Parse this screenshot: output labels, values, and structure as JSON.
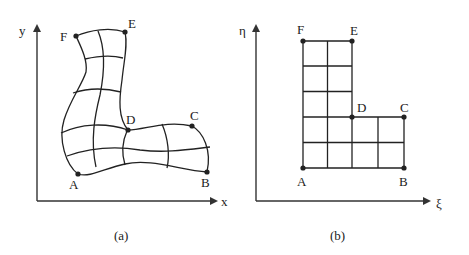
{
  "panels": [
    {
      "id": "a",
      "caption": "(a)",
      "axes": {
        "horizontal": "x",
        "vertical": "y"
      },
      "domain": "physical",
      "points": {
        "A": "A",
        "B": "B",
        "C": "C",
        "D": "D",
        "E": "E",
        "F": "F"
      },
      "description": "Curvilinear body-fitted grid over an L-shaped region in physical (x, y) space"
    },
    {
      "id": "b",
      "caption": "(b)",
      "axes": {
        "horizontal": "ξ",
        "vertical": "η"
      },
      "domain": "computational",
      "points": {
        "A": "A",
        "B": "B",
        "C": "C",
        "D": "D",
        "E": "E",
        "F": "F"
      },
      "description": "Uniform rectangular grid over an L-shaped region in computational (ξ, η) space"
    }
  ],
  "colors": {
    "line": "#222222",
    "background": "#ffffff"
  }
}
